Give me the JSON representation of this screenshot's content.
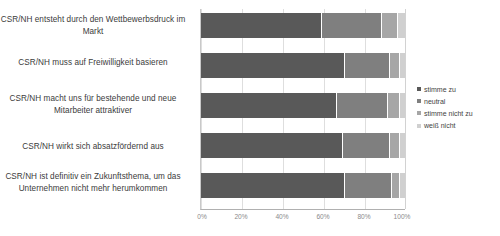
{
  "chart_data": {
    "type": "bar",
    "orientation": "horizontal",
    "stacked": true,
    "stack_mode": "percent",
    "title": "",
    "xlabel": "",
    "ylabel": "",
    "xlim": [
      0,
      100
    ],
    "xticks": [
      "0%",
      "20%",
      "40%",
      "60%",
      "80%",
      "100%"
    ],
    "xtick_values": [
      0,
      20,
      40,
      60,
      80,
      100
    ],
    "grid": true,
    "grid_axis": "x",
    "legend_position": "right",
    "categories": [
      "CSR/NH entsteht durch den Wettbewerbsdruck im Markt",
      "CSR/NH muss auf Freiwilligkeit basieren",
      "CSR/NH macht uns für bestehende und neue Mitarbeiter attraktiver",
      "CSR/NH wirkt sich absatzfördernd aus",
      "CSR/NH ist definitiv ein Zukunftsthema, um das Unternehmen nicht mehr herumkommen"
    ],
    "series": [
      {
        "name": "stimme zu",
        "color": "#595959",
        "values": [
          59,
          70,
          66,
          69,
          70
        ]
      },
      {
        "name": "neutral",
        "color": "#7f7f7f",
        "values": [
          29,
          22,
          25,
          23,
          23
        ]
      },
      {
        "name": "stimme nicht zu",
        "color": "#a6a6a6",
        "values": [
          8,
          5,
          6,
          5,
          4
        ]
      },
      {
        "name": "weiß nicht",
        "color": "#d0d0d0",
        "values": [
          4,
          3,
          3,
          3,
          3
        ]
      }
    ]
  },
  "legend": {
    "items": [
      {
        "label": "stimme zu"
      },
      {
        "label": "neutral"
      },
      {
        "label": "stimme nicht zu"
      },
      {
        "label": "weiß nicht"
      }
    ]
  }
}
